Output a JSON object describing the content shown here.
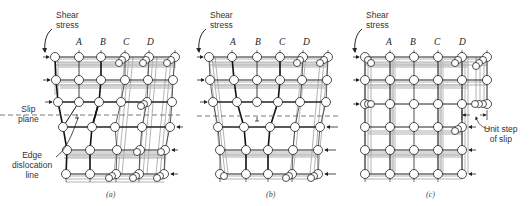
{
  "figure": {
    "panels": [
      {
        "id": "a",
        "caption": "(a)",
        "column_labels": [
          "A",
          "B",
          "C",
          "D"
        ],
        "annotations": {
          "shear_stress": [
            "Shear",
            "stress"
          ],
          "slip_plane": [
            "Slip",
            "plane"
          ],
          "edge_dislocation": [
            "Edge",
            "dislocation",
            "line"
          ]
        },
        "state": "extra half-plane of atoms above slip plane at columns A/B"
      },
      {
        "id": "b",
        "caption": "(b)",
        "column_labels": [
          "A",
          "B",
          "C",
          "D"
        ],
        "annotations": {
          "shear_stress": [
            "Shear",
            "stress"
          ]
        },
        "state": "dislocation moved one step right, extra half-plane at column B"
      },
      {
        "id": "c",
        "caption": "(c)",
        "column_labels": [
          "A",
          "B",
          "C",
          "D"
        ],
        "annotations": {
          "shear_stress": [
            "Shear",
            "stress"
          ],
          "unit_step": [
            "Unit step",
            "of slip"
          ]
        },
        "state": "dislocation exited crystal, unit step of slip on right face"
      }
    ],
    "colors": {
      "background": "#ffffff",
      "line": "#222222",
      "atom_fill": "#ffffff",
      "dashed_plane": "#555555"
    }
  }
}
